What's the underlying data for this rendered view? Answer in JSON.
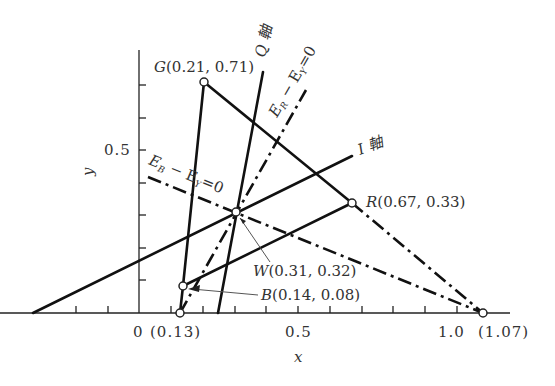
{
  "diagram": {
    "axes": {
      "x_label": "x",
      "y_label": "y",
      "x_ticks": [
        "0",
        "0.5",
        "1.0"
      ],
      "y_ticks": [
        "0.5"
      ],
      "x_special": [
        "(0.13)",
        "(1.07)"
      ]
    },
    "points": {
      "G": {
        "name": "G",
        "coords": "(0.21, 0.71)"
      },
      "R": {
        "name": "R",
        "coords": "(0.67, 0.33)"
      },
      "B": {
        "name": "B",
        "coords": "(0.14, 0.08)"
      },
      "W": {
        "name": "W",
        "coords": "(0.31, 0.32)"
      }
    },
    "line_labels": {
      "q_axis": "Q 軸",
      "i_axis": "I 軸",
      "er_ey": "E",
      "er_sub": "R",
      "er_mid": " − E",
      "er_sub2": "Y",
      "er_end": "=0",
      "eb_ey": "E",
      "eb_sub": "B",
      "eb_mid": " − E",
      "eb_sub2": "Y",
      "eb_end": "=0"
    }
  }
}
